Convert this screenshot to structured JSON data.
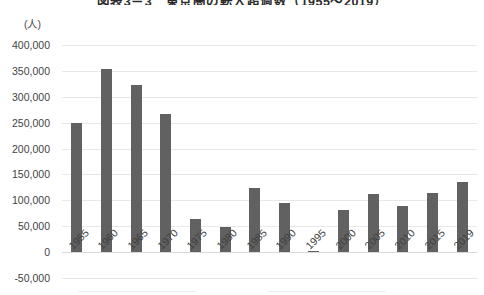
{
  "chart_data": {
    "type": "bar",
    "title": "図表3－3　東京圏の転入超過数（1955～2019）",
    "subtitle": "",
    "unit_label": "(人)",
    "xlabel": "",
    "ylabel": "",
    "ylim": [
      -50000,
      400000
    ],
    "ytick_step": 50000,
    "grid": true,
    "legend": "none",
    "bar_color": "#616161",
    "categories": [
      "1955",
      "1960",
      "1965",
      "1970",
      "1975",
      "1980",
      "1985",
      "1990",
      "1995",
      "2000",
      "2005",
      "2010",
      "2015",
      "2019"
    ],
    "values": [
      250000,
      353000,
      322000,
      267000,
      64000,
      49000,
      123000,
      94000,
      3000,
      82000,
      113000,
      90000,
      115000,
      135000
    ],
    "ytick_labels": [
      "400,000",
      "350,000",
      "300,000",
      "250,000",
      "200,000",
      "150,000",
      "100,000",
      "50,000",
      "0",
      "-50,000"
    ],
    "ytick_values": [
      400000,
      350000,
      300000,
      250000,
      200000,
      150000,
      100000,
      50000,
      0,
      -50000
    ]
  }
}
